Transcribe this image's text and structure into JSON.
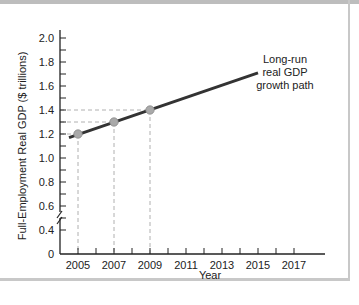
{
  "chart_data": {
    "type": "line",
    "title": "",
    "xlabel": "Year",
    "ylabel": "Full-Employment Real GDP ($ trillions)",
    "x_ticks": [
      "2005",
      "2007",
      "2009",
      "2011",
      "2013",
      "2015",
      "2017"
    ],
    "y_ticks": [
      "0",
      "0.4",
      "0.6",
      "0.8",
      "1.0",
      "1.2",
      "1.4",
      "1.6",
      "1.8",
      "2.0"
    ],
    "ylim": [
      0,
      2.0
    ],
    "xlim": [
      2004,
      2018
    ],
    "axis_break": true,
    "grid": false,
    "series": [
      {
        "name": "Long-run real GDP growth path",
        "x": [
          2004.5,
          2015
        ],
        "y": [
          1.17,
          1.71
        ]
      }
    ],
    "points": [
      {
        "x": 2005,
        "y": 1.2
      },
      {
        "x": 2007,
        "y": 1.3
      },
      {
        "x": 2009,
        "y": 1.4
      }
    ],
    "annotations": [
      {
        "text_lines": [
          "Long-run",
          "real GDP",
          "growth path"
        ]
      }
    ]
  },
  "colors": {
    "line": "#333333",
    "point": "#a9a9a9",
    "guide": "#b0b0b0"
  }
}
